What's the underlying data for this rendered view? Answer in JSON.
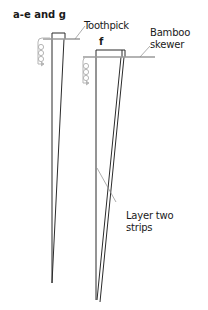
{
  "diagram": {
    "title": "a-e and g",
    "labels": {
      "toothpick": "Toothpick",
      "f": "f",
      "bamboo_skewer": "Bamboo\nskewer",
      "layer_strips": "Layer two\nstrips"
    },
    "colors": {
      "stroke": "#2b2b2b",
      "stick": "#9a9a9a",
      "coil": "#b5b5b5",
      "leader": "#8a8a8a"
    },
    "icons": [
      "coil-arrow-icon",
      "coil-arrow-icon"
    ]
  }
}
